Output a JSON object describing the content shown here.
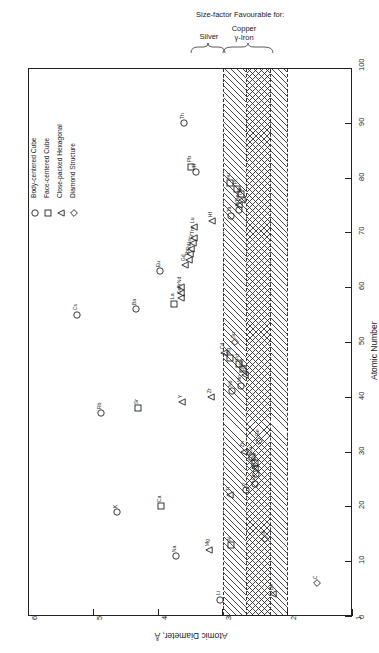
{
  "header": {
    "main_title": "Size-factor Favourable for:",
    "group_silver": "Silver",
    "group_copper_line1": "Copper",
    "group_copper_line2": "γ-Iron"
  },
  "axes": {
    "x_title": "Atomic Diameter, Å",
    "y_title": "Atomic Number",
    "x_ticks": [
      "6",
      "5",
      "4",
      "3",
      "2",
      "1"
    ],
    "y_ticks": [
      "0",
      "10",
      "20",
      "30",
      "40",
      "50",
      "60",
      "70",
      "80",
      "90",
      "100"
    ]
  },
  "legend": {
    "items": [
      {
        "symbol": "circle",
        "label": "Body-centered Cube"
      },
      {
        "symbol": "square",
        "label": "Face-centered Cube"
      },
      {
        "symbol": "triangle",
        "label": "Close-packed Hexagonal"
      },
      {
        "symbol": "diamond",
        "label": "Diamond Structure"
      }
    ]
  },
  "chart_data": {
    "type": "scatter",
    "xlabel": "Atomic Diameter, Å",
    "ylabel": "Atomic Number",
    "xlim": [
      6,
      1
    ],
    "ylim": [
      0,
      100
    ],
    "x_reversed": true,
    "grid": false,
    "legend_position": "upper-left",
    "bands": [
      {
        "name": "Silver",
        "x_from": 3.0,
        "x_to": 2.63,
        "hatch": "diagonal"
      },
      {
        "name": "Silver+Copper overlap",
        "x_from": 2.63,
        "x_to": 2.26,
        "hatch": "cross"
      },
      {
        "name": "Copper / γ-Iron",
        "x_from": 2.26,
        "x_to": 2.01,
        "hatch": "diagonal"
      }
    ],
    "series": [
      {
        "name": "Body-centered Cube",
        "symbol": "circle",
        "points": [
          {
            "label": "Li",
            "z": 3,
            "d": 3.03
          },
          {
            "label": "Na",
            "z": 11,
            "d": 3.72
          },
          {
            "label": "K",
            "z": 19,
            "d": 4.62
          },
          {
            "label": "V",
            "z": 23,
            "d": 2.63
          },
          {
            "label": "Cr",
            "z": 24,
            "d": 2.49
          },
          {
            "label": "Fe",
            "z": 26,
            "d": 2.48
          },
          {
            "label": "Rb",
            "z": 37,
            "d": 4.88
          },
          {
            "label": "Nb",
            "z": 41,
            "d": 2.85
          },
          {
            "label": "Mo",
            "z": 42,
            "d": 2.72
          },
          {
            "label": "Cs",
            "z": 55,
            "d": 5.24
          },
          {
            "label": "Ba",
            "z": 56,
            "d": 4.34
          },
          {
            "label": "Eu",
            "z": 63,
            "d": 3.96
          },
          {
            "label": "Ta",
            "z": 73,
            "d": 2.86
          },
          {
            "label": "W",
            "z": 74,
            "d": 2.74
          },
          {
            "label": "Tl",
            "z": 81,
            "d": 3.4
          },
          {
            "label": "Th",
            "z": 90,
            "d": 3.6
          }
        ]
      },
      {
        "name": "Face-centered Cube",
        "symbol": "square",
        "points": [
          {
            "label": "Al",
            "z": 13,
            "d": 2.86
          },
          {
            "label": "Ca",
            "z": 20,
            "d": 3.94
          },
          {
            "label": "Ni",
            "z": 28,
            "d": 2.49
          },
          {
            "label": "Cu",
            "z": 29,
            "d": 2.55
          },
          {
            "label": "Sr",
            "z": 38,
            "d": 4.3
          },
          {
            "label": "Rh",
            "z": 45,
            "d": 2.68
          },
          {
            "label": "Pd",
            "z": 46,
            "d": 2.74
          },
          {
            "label": "Ag",
            "z": 47,
            "d": 2.88
          },
          {
            "label": "La",
            "z": 57,
            "d": 3.74
          },
          {
            "label": "Ir",
            "z": 77,
            "d": 2.71
          },
          {
            "label": "Pt",
            "z": 78,
            "d": 2.77
          },
          {
            "label": "Au",
            "z": 79,
            "d": 2.88
          },
          {
            "label": "Pb",
            "z": 82,
            "d": 3.49
          }
        ]
      },
      {
        "name": "Close-packed Hexagonal",
        "symbol": "triangle",
        "points": [
          {
            "label": "Be",
            "z": 4,
            "d": 2.22
          },
          {
            "label": "Mg",
            "z": 12,
            "d": 3.2
          },
          {
            "label": "Ti",
            "z": 22,
            "d": 2.89
          },
          {
            "label": "Co",
            "z": 27,
            "d": 2.5
          },
          {
            "label": "Zn",
            "z": 30,
            "d": 2.66
          },
          {
            "label": "Y",
            "z": 39,
            "d": 3.62
          },
          {
            "label": "Zr",
            "z": 40,
            "d": 3.17
          },
          {
            "label": "Ru",
            "z": 44,
            "d": 2.65
          },
          {
            "label": "Cd",
            "z": 48,
            "d": 2.97
          },
          {
            "label": "Ce",
            "z": 58,
            "d": 3.64
          },
          {
            "label": "Pr",
            "z": 59,
            "d": 3.64
          },
          {
            "label": "Nd",
            "z": 60,
            "d": 3.64
          },
          {
            "label": "Gd",
            "z": 64,
            "d": 3.58
          },
          {
            "label": "Tb",
            "z": 65,
            "d": 3.52
          },
          {
            "label": "Dy",
            "z": 66,
            "d": 3.5
          },
          {
            "label": "Ho",
            "z": 67,
            "d": 3.48
          },
          {
            "label": "Er",
            "z": 68,
            "d": 3.46
          },
          {
            "label": "Tm",
            "z": 69,
            "d": 3.44
          },
          {
            "label": "Lu",
            "z": 71,
            "d": 3.44
          },
          {
            "label": "Hf",
            "z": 72,
            "d": 3.16
          },
          {
            "label": "Re",
            "z": 75,
            "d": 2.74
          },
          {
            "label": "Os",
            "z": 76,
            "d": 2.7
          }
        ]
      },
      {
        "name": "Diamond Structure",
        "symbol": "diamond",
        "points": [
          {
            "label": "C",
            "z": 6,
            "d": 1.54
          },
          {
            "label": "Si",
            "z": 14,
            "d": 2.34
          },
          {
            "label": "Ge",
            "z": 32,
            "d": 2.44
          },
          {
            "label": "Sn",
            "z": 50,
            "d": 2.8
          }
        ]
      }
    ]
  }
}
